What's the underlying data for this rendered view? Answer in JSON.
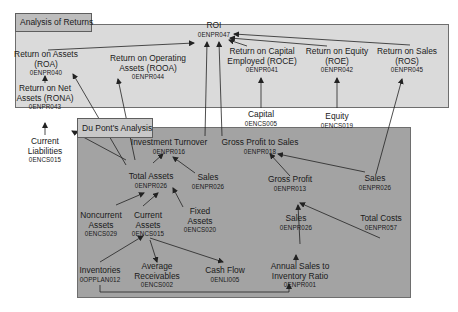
{
  "panels": {
    "returns": {
      "label": "Analysis of Returns",
      "color": "#dadada"
    },
    "dupont": {
      "label": "Du Pont's Analysis",
      "color": "#a3a3a3"
    }
  },
  "nodes": {
    "roi": {
      "title": "ROI",
      "code": "0ENPR047"
    },
    "roa": {
      "title": "Return on Assets\n(ROA)",
      "line1": "Return on Assets",
      "line2": "(ROA)",
      "code": "0ENPR040"
    },
    "rona": {
      "line1": "Return on Net",
      "line2": "Assets (RONA)",
      "code": "0ENPR043"
    },
    "rooa": {
      "line1": "Return on Operating",
      "line2": "Assets (ROOA)",
      "code": "0ENPR044"
    },
    "roce": {
      "line1": "Return on Capital",
      "line2": "Employed (ROCE)",
      "code": "0ENPR041"
    },
    "roe": {
      "line1": "Return on Equity",
      "line2": "(ROE)",
      "code": "0ENPR042"
    },
    "ros": {
      "line1": "Return on Sales",
      "line2": "(ROS)",
      "code": "0ENPR045"
    },
    "capital": {
      "line1": "Capital",
      "code": "0ENCS005"
    },
    "equity": {
      "line1": "Equity",
      "code": "0ENCS019"
    },
    "current_liabilities": {
      "line1": "Current",
      "line2": "Liabilities",
      "code": "0ENCS015"
    },
    "investment_turnover": {
      "line1": "Investment Turnover",
      "code": "0ENPR016"
    },
    "gross_profit_to_sales": {
      "line1": "Gross Profit to Sales",
      "code": "0ENPR018"
    },
    "total_assets": {
      "line1": "Total Assets",
      "code": "0ENPR026"
    },
    "sales_it": {
      "line1": "Sales",
      "code": "0ENPR026"
    },
    "sales_gps": {
      "line1": "Sales",
      "code": "0ENPR026"
    },
    "gross_profit": {
      "line1": "Gross Profit",
      "code": "0ENPR013"
    },
    "noncurrent_assets": {
      "line1": "Noncurrent",
      "line2": "Assets",
      "code": "0ENCS029"
    },
    "current_assets": {
      "line1": "Current",
      "line2": "Assets",
      "code": "0ENCS015"
    },
    "fixed_assets": {
      "line1": "Fixed",
      "line2": "Assets",
      "code": "0ENCS020"
    },
    "sales_gp": {
      "line1": "Sales",
      "code": "0ENPR026"
    },
    "total_costs": {
      "line1": "Total Costs",
      "code": "0ENPR057"
    },
    "inventories": {
      "line1": "Inventories",
      "code": "0OPPLAN012"
    },
    "average_receivables": {
      "line1": "Average",
      "line2": "Receivables",
      "code": "0ENCS002"
    },
    "cash_flow": {
      "line1": "Cash Flow",
      "code": "0ENLI005"
    },
    "annual_sales_inventory": {
      "line1": "Annual Sales to",
      "line2": "Inventory Ratio",
      "code": "0ENPR001"
    }
  },
  "colors": {
    "line": "#222222",
    "border": "#6e6e6e"
  }
}
